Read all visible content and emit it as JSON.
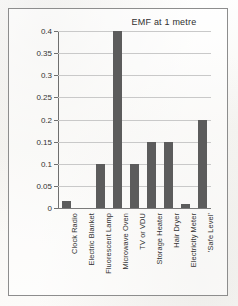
{
  "figure": {
    "title": "EMF at 1 metre",
    "frame_color": "#8d8d8d",
    "bar_color": "#5c5c5c",
    "grid_color": "#c9c9c9"
  },
  "chart_data": {
    "type": "bar",
    "title": "EMF at 1 metre",
    "xlabel": "",
    "ylabel": "",
    "ylim": [
      0,
      0.4
    ],
    "grid": true,
    "legend": "none",
    "categories": [
      "Clock Radio",
      "Electric Blanket",
      "Fluorescent Lamp",
      "Microwave Oven",
      "TV or VDU",
      "Storage Heater",
      "Hair Dryer",
      "Electricity Meter",
      "'Safe Level'"
    ],
    "values": [
      0.015,
      0,
      0.1,
      0.4,
      0.1,
      0.15,
      0.15,
      0.01,
      0.2
    ],
    "yticks": [
      0,
      0.05,
      0.1,
      0.15,
      0.2,
      0.25,
      0.3,
      0.35,
      0.4
    ],
    "ytick_labels": [
      "0",
      "0.05",
      "0.1",
      "0.15",
      "0.2",
      "0.25",
      "0.3",
      "0.35",
      "0.4"
    ]
  }
}
